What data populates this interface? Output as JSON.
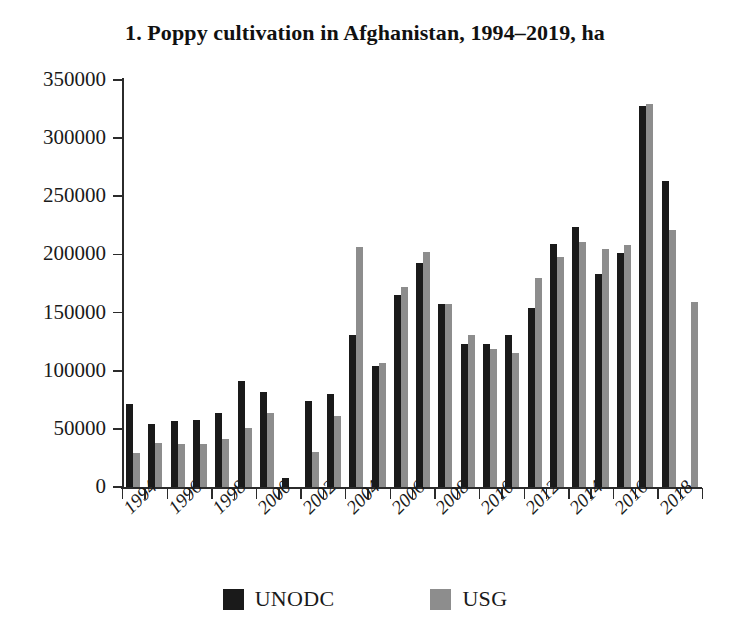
{
  "chart_data": {
    "type": "bar",
    "title": "1. Poppy cultivation in Afghanistan, 1994–2019, ha",
    "xlabel": "",
    "ylabel": "",
    "ylim": [
      0,
      350000
    ],
    "ytick_values": [
      0,
      50000,
      100000,
      150000,
      200000,
      250000,
      300000,
      350000
    ],
    "ytick_labels": [
      "0",
      "50000",
      "100000",
      "150000",
      "200000",
      "250000",
      "300000",
      "350000"
    ],
    "grid": false,
    "legend_position": "bottom",
    "x": [
      1994,
      1995,
      1996,
      1997,
      1998,
      1999,
      2000,
      2001,
      2002,
      2003,
      2004,
      2005,
      2006,
      2007,
      2008,
      2009,
      2010,
      2011,
      2012,
      2013,
      2014,
      2015,
      2016,
      2017,
      2018,
      2019
    ],
    "categories": [
      "1994",
      "1995",
      "1996",
      "1997",
      "1998",
      "1999",
      "2000",
      "2001",
      "2002",
      "2003",
      "2004",
      "2005",
      "2006",
      "2007",
      "2008",
      "2009",
      "2010",
      "2011",
      "2012",
      "2013",
      "2014",
      "2015",
      "2016",
      "2017",
      "2018",
      "2019"
    ],
    "xtick_labels_shown": [
      "1994",
      "1996",
      "1998",
      "2000",
      "2002",
      "2004",
      "2006",
      "2008",
      "2010",
      "2012",
      "2014",
      "2016",
      "2018"
    ],
    "series": [
      {
        "name": "UNODC",
        "color": "#1a1a1a",
        "values": [
          71000,
          54000,
          57000,
          58000,
          64000,
          91000,
          82000,
          8000,
          74000,
          80000,
          131000,
          104000,
          165000,
          193000,
          157000,
          123000,
          123000,
          131000,
          154000,
          209000,
          224000,
          183000,
          201000,
          328000,
          263000,
          null
        ]
      },
      {
        "name": "USG",
        "color": "#8d8d8d",
        "values": [
          29000,
          38000,
          37000,
          37000,
          41000,
          51000,
          64000,
          null,
          30000,
          61000,
          206000,
          107000,
          172000,
          202000,
          157000,
          131000,
          119000,
          115000,
          180000,
          198000,
          211000,
          205000,
          208000,
          329000,
          221000,
          159000
        ]
      }
    ]
  },
  "legend": {
    "entries": [
      {
        "label": "UNODC",
        "color": "#1a1a1a"
      },
      {
        "label": "USG",
        "color": "#8d8d8d"
      }
    ]
  }
}
